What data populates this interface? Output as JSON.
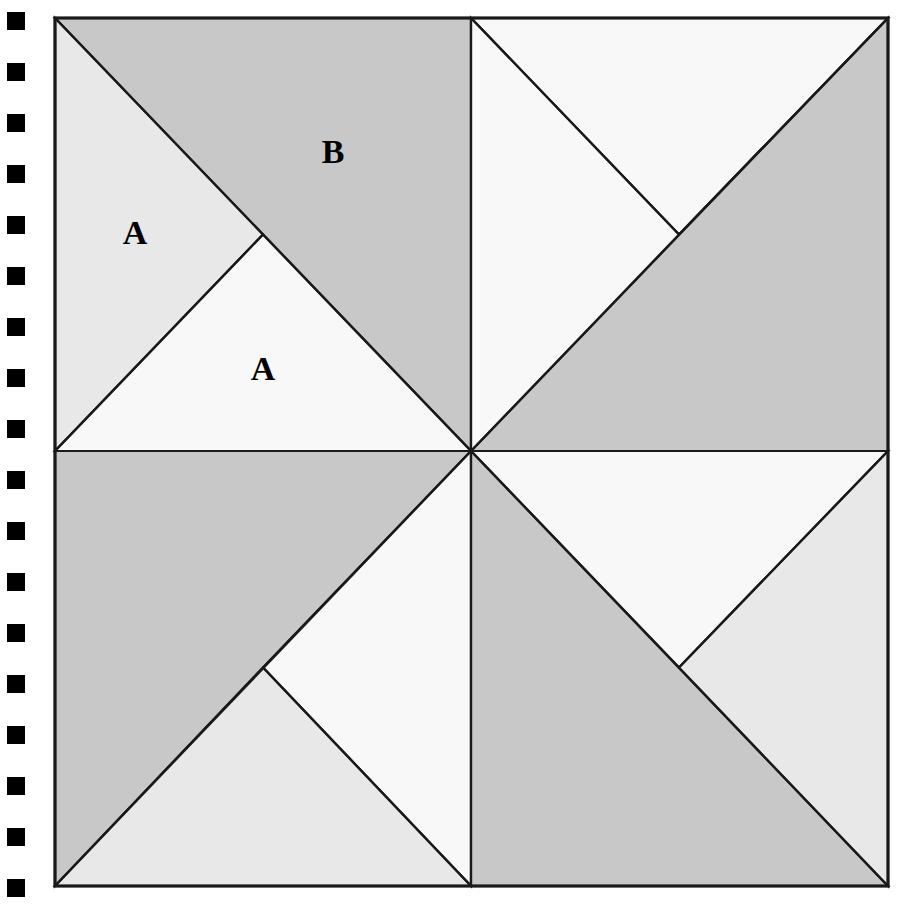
{
  "figure": {
    "canvas": {
      "width": 905,
      "height": 906,
      "background": "#ffffff"
    },
    "square": {
      "x0": 55,
      "y0": 18,
      "x1": 888,
      "y1": 886
    },
    "center": {
      "x": 471,
      "y": 451
    },
    "stroke_color": "#1a1a1a",
    "palette": {
      "lightest": "#f8f8f8",
      "light": "#e8e8e8",
      "medium": "#c8c8c8",
      "outline": "#1a1a1a",
      "marker": "#000000"
    },
    "labels": [
      {
        "text": "A",
        "x": 135,
        "y": 236
      },
      {
        "text": "B",
        "x": 333,
        "y": 155
      },
      {
        "text": "A",
        "x": 263,
        "y": 372
      }
    ],
    "quadrants": [
      {
        "name": "top-left",
        "regions": [
          {
            "name": "tl-upper-triangle",
            "shade": "medium",
            "points": "55,18 471,18 471,451 263,234.5"
          },
          {
            "name": "tl-left-triangle",
            "shade": "light",
            "points": "55,18 263,234.5 55,451"
          },
          {
            "name": "tl-lower-triangle",
            "shade": "lightest",
            "points": "263,234.5 471,451 55,451"
          }
        ]
      },
      {
        "name": "top-right",
        "regions": [
          {
            "name": "tr-upper-triangle",
            "shade": "lightest",
            "points": "471,18 888,18 679,234.5"
          },
          {
            "name": "tr-right-triangle",
            "shade": "medium",
            "points": "888,18 888,451 471,451 679,234.5"
          },
          {
            "name": "tr-left-triangle",
            "shade": "lightest",
            "points": "471,18 679,234.5 471,451"
          }
        ]
      },
      {
        "name": "bottom-left",
        "regions": [
          {
            "name": "bl-upper-triangle",
            "shade": "medium",
            "points": "55,451 471,451 263,667.5 55,886"
          },
          {
            "name": "bl-right-triangle",
            "shade": "lightest",
            "points": "471,451 471,886 263,667.5"
          },
          {
            "name": "bl-lower-triangle",
            "shade": "light",
            "points": "263,667.5 471,886 55,886"
          }
        ]
      },
      {
        "name": "bottom-right",
        "regions": [
          {
            "name": "br-upper-triangle",
            "shade": "lightest",
            "points": "471,451 888,451 679,667.5"
          },
          {
            "name": "br-left-triangle",
            "shade": "medium",
            "points": "471,451 679,667.5 888,886 471,886"
          },
          {
            "name": "br-right-triangle",
            "shade": "light",
            "points": "888,451 888,886 679,667.5"
          }
        ]
      }
    ],
    "divider_lines": [
      {
        "name": "vertical-midline",
        "x1": 471,
        "y1": 18,
        "x2": 471,
        "y2": 886
      },
      {
        "name": "horizontal-midline",
        "x1": 55,
        "y1": 451,
        "x2": 888,
        "y2": 451
      },
      {
        "name": "diagonal-tl",
        "x1": 55,
        "y1": 18,
        "x2": 471,
        "y2": 451
      },
      {
        "name": "diagonal-tr",
        "x1": 888,
        "y1": 18,
        "x2": 471,
        "y2": 451
      },
      {
        "name": "diagonal-bl",
        "x1": 55,
        "y1": 886,
        "x2": 471,
        "y2": 451
      },
      {
        "name": "diagonal-br",
        "x1": 888,
        "y1": 886,
        "x2": 471,
        "y2": 451
      },
      {
        "name": "cut-tl",
        "x1": 55,
        "y1": 451,
        "x2": 263,
        "y2": 234.5
      },
      {
        "name": "cut-tr",
        "x1": 888,
        "y1": 18,
        "x2": 679,
        "y2": 234.5
      },
      {
        "name": "cut-tr-inner",
        "x1": 471,
        "y1": 18,
        "x2": 679,
        "y2": 234.5
      },
      {
        "name": "cut-bl",
        "x1": 471,
        "y1": 886,
        "x2": 263,
        "y2": 667.5
      },
      {
        "name": "cut-br",
        "x1": 888,
        "y1": 451,
        "x2": 679,
        "y2": 667.5
      }
    ]
  },
  "markers": {
    "name": "left-edge-markers",
    "count": 18,
    "size": 18,
    "start_y": 12,
    "spacing": 51,
    "color": "#000000"
  }
}
